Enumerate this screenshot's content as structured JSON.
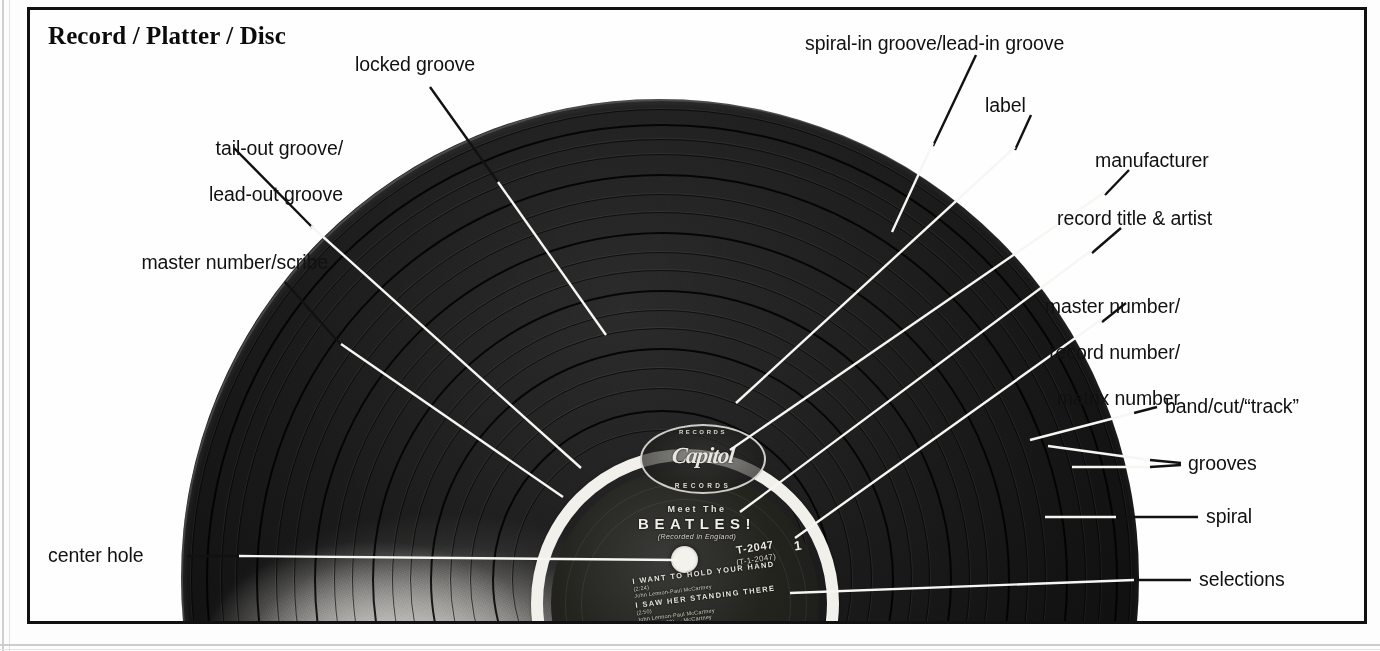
{
  "figure": {
    "title": "Record / Platter / Disc"
  },
  "annotations": [
    {
      "id": "record-platter-disc",
      "text": "Record / Platter / Disc"
    },
    {
      "id": "locked-groove",
      "text": "locked groove"
    },
    {
      "id": "spiral-in-groove",
      "text": "spiral-in groove/lead-in groove"
    },
    {
      "id": "label",
      "text": "label"
    },
    {
      "id": "manufacturer",
      "text": "manufacturer"
    },
    {
      "id": "record-title-artist",
      "text": "record title & artist"
    },
    {
      "id": "tail-out-groove",
      "line1": "tail-out groove/",
      "line2": "lead-out groove"
    },
    {
      "id": "master-number-scribe",
      "text": "master number/scribe"
    },
    {
      "id": "master-record-matrix",
      "line1": "master number/",
      "line2": "record number/",
      "line3": "matrix number"
    },
    {
      "id": "band-cut-track",
      "text": "band/cut/“track”"
    },
    {
      "id": "grooves",
      "text": "grooves"
    },
    {
      "id": "spiral",
      "text": "spiral"
    },
    {
      "id": "selections",
      "text": "selections"
    },
    {
      "id": "center-hole",
      "text": "center hole"
    }
  ],
  "record_label": {
    "manufacturer_logo_top": "RECORDS",
    "manufacturer_script": "Capitol",
    "manufacturer_logo_bottom": "RECORDS",
    "album_prefix": "Meet The",
    "album_title": "BEATLES!",
    "note": "(Recorded in England)",
    "catalog_number": "T-2047",
    "catalog_sub": "(T-1-2047)",
    "side_mark": "1",
    "tracks": [
      {
        "num": "1.",
        "title": "I WANT TO HOLD YOUR HAND",
        "credit1": "(2:24)",
        "credit2": "John Lennon-Paul McCartney"
      },
      {
        "num": "2.",
        "title": "I SAW HER STANDING THERE",
        "credit1": "(2:50)",
        "credit2": "John Lennon-Paul McCartney",
        "credit3": "(ASCAP 2:33) — McCartney"
      }
    ]
  },
  "colors": {
    "ink": "#111111",
    "paper": "#fdfdfd",
    "vinyl": "#0d0d0d",
    "label_ring": "#f2f0ea",
    "leader_dark": "#111111",
    "leader_light": "#f7f6f2"
  }
}
